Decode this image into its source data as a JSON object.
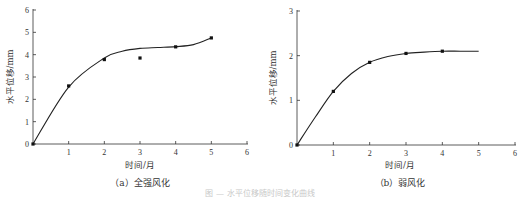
{
  "chart_data": [
    {
      "type": "scatter",
      "title": "",
      "caption": "（a）全强风化",
      "xlabel": "时间/月",
      "ylabel": "水平位移/mm",
      "xlim": [
        0,
        6
      ],
      "ylim": [
        0,
        6
      ],
      "xticks": [
        "1",
        "2",
        "3",
        "4",
        "5",
        "6"
      ],
      "yticks": [
        "0",
        "1",
        "2",
        "3",
        "4",
        "5",
        "6"
      ],
      "grid": false,
      "series": [
        {
          "name": "measured",
          "x": [
            0,
            1,
            2,
            3,
            4,
            5
          ],
          "values": [
            0,
            2.6,
            3.78,
            3.85,
            4.35,
            4.75
          ]
        },
        {
          "name": "fit curve",
          "x": [
            0,
            1,
            2,
            2.5,
            3,
            3.5,
            4,
            4.5,
            5
          ],
          "values": [
            0,
            2.55,
            3.85,
            4.15,
            4.28,
            4.32,
            4.36,
            4.45,
            4.75
          ]
        }
      ]
    },
    {
      "type": "scatter",
      "title": "",
      "caption": "（b）弱风化",
      "xlabel": "时间/月",
      "ylabel": "水平位移/mm",
      "xlim": [
        0,
        6
      ],
      "ylim": [
        0,
        3
      ],
      "xticks": [
        "1",
        "2",
        "3",
        "4",
        "5",
        "6"
      ],
      "yticks": [
        "0",
        "1",
        "2",
        "3"
      ],
      "grid": false,
      "series": [
        {
          "name": "measured",
          "x": [
            0,
            1,
            2,
            3,
            4
          ],
          "values": [
            0,
            1.2,
            1.85,
            2.05,
            2.1
          ]
        },
        {
          "name": "fit curve",
          "x": [
            0,
            0.5,
            1,
            1.5,
            2,
            2.5,
            3,
            3.5,
            4,
            4.5,
            5
          ],
          "values": [
            0,
            0.62,
            1.2,
            1.6,
            1.85,
            1.98,
            2.05,
            2.08,
            2.1,
            2.1,
            2.1
          ]
        }
      ]
    }
  ],
  "figure_caption_faint": "图 — 水平位移随时间变化曲线"
}
